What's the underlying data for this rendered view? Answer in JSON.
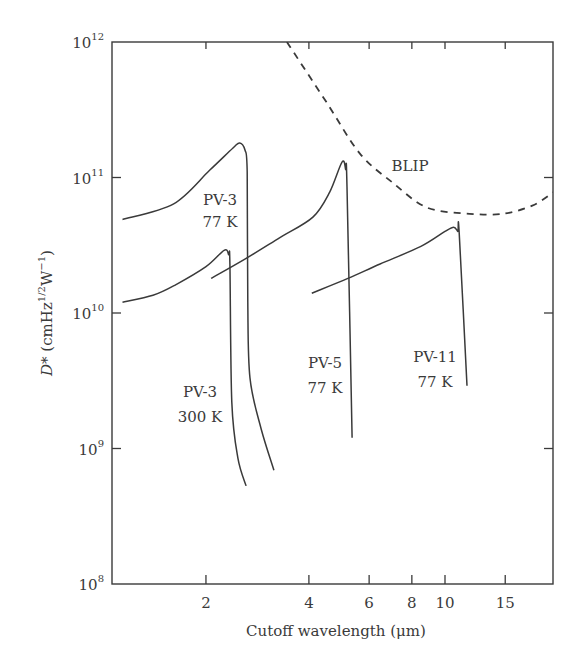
{
  "chart_data": {
    "type": "line",
    "title": "",
    "xlabel": "Cutoff wavelength (μm)",
    "ylabel": "D* (cmHz^1/2 W^-1)",
    "ylabel_parts": {
      "main": "D* (cmHz",
      "sup1": "1/2",
      "mid": "W",
      "sup2": "−1",
      "end": ")"
    },
    "x_scale": "log",
    "y_scale": "log",
    "xlim": [
      1.06,
      21
    ],
    "ylim": [
      100000000.0,
      1000000000000.0
    ],
    "x_ticks": [
      2,
      4,
      6,
      8,
      10,
      15
    ],
    "x_tick_labels": [
      "2",
      "4",
      "6",
      "8",
      "10",
      "15"
    ],
    "y_ticks": [
      100000000.0,
      1000000000.0,
      10000000000.0,
      100000000000.0,
      1000000000000.0
    ],
    "y_tick_labels": [
      {
        "base": "10",
        "exp": "8"
      },
      {
        "base": "10",
        "exp": "9"
      },
      {
        "base": "10",
        "exp": "10"
      },
      {
        "base": "10",
        "exp": "11"
      },
      {
        "base": "10",
        "exp": "12"
      }
    ],
    "grid": false,
    "legend": "none (inline curve labels)",
    "series": [
      {
        "name": "PV-3 77 K",
        "label_lines": [
          "PV-3",
          "77 K"
        ],
        "style": "solid",
        "points": [
          [
            1.14,
            49000000000.0
          ],
          [
            1.61,
            64000000000.0
          ],
          [
            2.05,
            113000000000.0
          ],
          [
            2.4,
            165000000000.0
          ],
          [
            2.51,
            180000000000.0
          ],
          [
            2.6,
            160000000000.0
          ],
          [
            2.64,
            110000000000.0
          ],
          [
            2.65,
            12000000000.0
          ],
          [
            2.69,
            3300000000.0
          ],
          [
            2.9,
            1400000000.0
          ],
          [
            3.16,
            690000000.0
          ]
        ]
      },
      {
        "name": "PV-3 300 K",
        "label_lines": [
          "PV-3",
          "300 K"
        ],
        "style": "solid",
        "points": [
          [
            1.14,
            12000000000.0
          ],
          [
            1.4,
            13500000000.0
          ],
          [
            1.62,
            16000000000.0
          ],
          [
            2.0,
            22000000000.0
          ],
          [
            2.26,
            29000000000.0
          ],
          [
            2.33,
            27000000000.0
          ],
          [
            2.35,
            23000000000.0
          ],
          [
            2.38,
            2200000000.0
          ],
          [
            2.48,
            850000000.0
          ],
          [
            2.62,
            530000000.0
          ]
        ]
      },
      {
        "name": "PV-5 77 K",
        "label_lines": [
          "PV-5",
          "77 K"
        ],
        "style": "solid",
        "points": [
          [
            2.07,
            18000000000.0
          ],
          [
            2.6,
            25000000000.0
          ],
          [
            3.29,
            36000000000.0
          ],
          [
            4.11,
            51000000000.0
          ],
          [
            4.6,
            78000000000.0
          ],
          [
            5.0,
            130000000000.0
          ],
          [
            5.12,
            115000000000.0
          ],
          [
            5.17,
            85000000000.0
          ],
          [
            5.35,
            1200000000.0
          ]
        ]
      },
      {
        "name": "PV-11 77 K",
        "label_lines": [
          "PV-11",
          "77 K"
        ],
        "style": "solid",
        "points": [
          [
            4.08,
            14000000000.0
          ],
          [
            5.2,
            18000000000.0
          ],
          [
            6.46,
            23000000000.0
          ],
          [
            8.5,
            31000000000.0
          ],
          [
            10.0,
            40000000000.0
          ],
          [
            10.6,
            43000000000.0
          ],
          [
            10.9,
            40000000000.0
          ],
          [
            11.0,
            39000000000.0
          ],
          [
            11.6,
            2900000000.0
          ]
        ]
      },
      {
        "name": "BLIP",
        "label_lines": [
          "BLIP"
        ],
        "style": "dashed",
        "points": [
          [
            3.45,
            1000000000000.0
          ],
          [
            4.5,
            360000000000.0
          ],
          [
            5.64,
            150000000000.0
          ],
          [
            7.05,
            91000000000.0
          ],
          [
            8.86,
            60000000000.0
          ],
          [
            11.8,
            54000000000.0
          ],
          [
            14.8,
            54000000000.0
          ],
          [
            18.0,
            62000000000.0
          ],
          [
            20.5,
            76000000000.0
          ],
          [
            21.0,
            80000000000.0
          ]
        ]
      }
    ],
    "annotations": [
      {
        "text": [
          "PV-3",
          "77 K"
        ],
        "x_px": 220,
        "y_px": [
          205,
          227
        ]
      },
      {
        "text": [
          "PV-3",
          "300 K"
        ],
        "x_px": 200,
        "y_px": [
          397,
          422
        ]
      },
      {
        "text": [
          "PV-5",
          "77 K"
        ],
        "x_px": 325,
        "y_px": [
          368,
          393
        ]
      },
      {
        "text": [
          "PV-11",
          "77 K"
        ],
        "x_px": 435,
        "y_px": [
          362,
          387
        ]
      },
      {
        "text": [
          "BLIP"
        ],
        "x_px": 410,
        "y_px": [
          171
        ]
      }
    ]
  },
  "colors": {
    "axis": "#3a3a3a",
    "curve": "#3a3a3a",
    "background": "#ffffff"
  }
}
